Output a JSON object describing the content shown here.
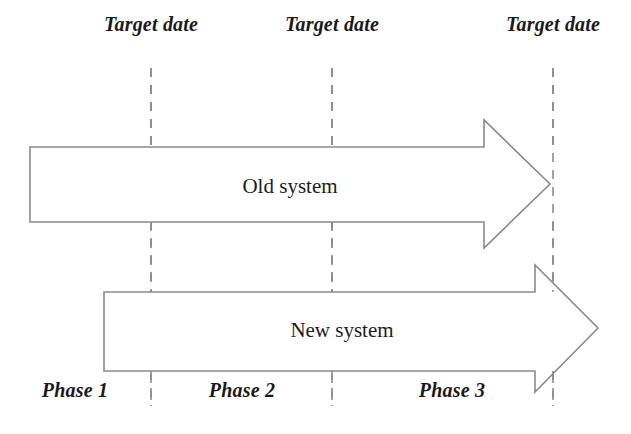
{
  "diagram": {
    "type": "phased-migration-timeline",
    "background_color": "#ffffff",
    "stroke_color": "#8a8a8a",
    "text_color": "#1a1a1a",
    "milestones": [
      {
        "label": "Target date",
        "x": 151
      },
      {
        "label": "Target date",
        "x": 332
      },
      {
        "label": "Target date",
        "x": 553
      }
    ],
    "arrows": [
      {
        "name": "old-system",
        "label": "Old system",
        "label_x": 290,
        "label_y": 176,
        "body_left": 30,
        "body_top": 147,
        "body_bottom": 222,
        "head_start": 484,
        "head_top": 120,
        "head_bottom": 248,
        "tip_x": 550,
        "tip_y": 184
      },
      {
        "name": "new-system",
        "label": "New system",
        "label_x": 342,
        "label_y": 320,
        "body_left": 104,
        "body_top": 292,
        "body_bottom": 371,
        "head_start": 535,
        "head_top": 265,
        "head_bottom": 392,
        "tip_x": 598,
        "tip_y": 328
      }
    ],
    "phases": [
      {
        "label": "Phase 1",
        "x": 75
      },
      {
        "label": "Phase 2",
        "x": 242
      },
      {
        "label": "Phase 3",
        "x": 452
      }
    ],
    "dashed_lines": {
      "top": 68,
      "bottom": 406,
      "dash": "9 8",
      "width": 1.6
    }
  }
}
